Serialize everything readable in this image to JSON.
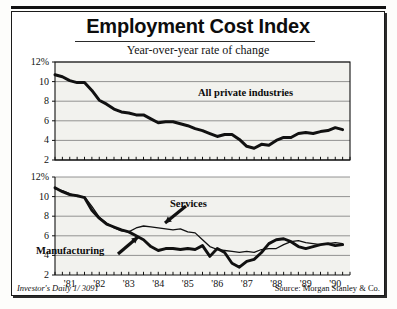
{
  "header": {
    "title": "Employment Cost Index",
    "subtitle": "Year-over-year rate of change"
  },
  "footer": {
    "left": "Investor's Daily 1/ 3091",
    "right": "Source: Morgan Stanley & Co."
  },
  "chart_data": [
    {
      "type": "line",
      "id": "all-private-industries",
      "title": "All private industries",
      "xlabel": "",
      "ylabel": "",
      "ylim": [
        2,
        12
      ],
      "yticks": [
        2,
        4,
        6,
        8,
        10,
        12
      ],
      "ytick_labels": [
        "2",
        "4",
        "6",
        "8",
        "10",
        "12%"
      ],
      "grid": true,
      "legend_position": "inline-annotation",
      "xlim": [
        1981.0,
        1991.0
      ],
      "x": [
        1981.0,
        1981.25,
        1981.5,
        1981.75,
        1982.0,
        1982.25,
        1982.5,
        1982.75,
        1983.0,
        1983.25,
        1983.5,
        1983.75,
        1984.0,
        1984.25,
        1984.5,
        1984.75,
        1985.0,
        1985.25,
        1985.5,
        1985.75,
        1986.0,
        1986.25,
        1986.5,
        1986.75,
        1987.0,
        1987.25,
        1987.5,
        1987.75,
        1988.0,
        1988.25,
        1988.5,
        1988.75,
        1989.0,
        1989.25,
        1989.5,
        1989.75,
        1990.0,
        1990.25,
        1990.5,
        1990.75
      ],
      "series": [
        {
          "name": "All private industries",
          "values": [
            10.7,
            10.5,
            10.1,
            9.9,
            9.9,
            9.1,
            8.1,
            7.7,
            7.2,
            6.9,
            6.8,
            6.6,
            6.6,
            6.2,
            5.8,
            5.9,
            5.9,
            5.7,
            5.5,
            5.2,
            5.0,
            4.7,
            4.4,
            4.6,
            4.6,
            4.1,
            3.4,
            3.2,
            3.6,
            3.5,
            4.0,
            4.3,
            4.3,
            4.7,
            4.8,
            4.7,
            4.9,
            5.0,
            5.3,
            5.1
          ]
        }
      ]
    },
    {
      "type": "line",
      "id": "manufacturing-vs-services",
      "title": "",
      "xlabel": "",
      "ylabel": "",
      "ylim": [
        2,
        12
      ],
      "yticks": [
        2,
        4,
        6,
        8,
        10,
        12
      ],
      "ytick_labels": [
        "2",
        "4",
        "6",
        "8",
        "10",
        "12%"
      ],
      "grid": true,
      "legend_position": "inline-annotation",
      "xlim": [
        1981.0,
        1991.0
      ],
      "xtick_labels": [
        "'81",
        "'82",
        "'83",
        "'84",
        "'85",
        "'86",
        "'87",
        "'88",
        "'89",
        "'90"
      ],
      "xticks": [
        1981.5,
        1982.5,
        1983.5,
        1984.5,
        1985.5,
        1986.5,
        1987.5,
        1988.5,
        1989.5,
        1990.5
      ],
      "x": [
        1981.0,
        1981.25,
        1981.5,
        1981.75,
        1982.0,
        1982.25,
        1982.5,
        1982.75,
        1983.0,
        1983.25,
        1983.5,
        1983.75,
        1984.0,
        1984.25,
        1984.5,
        1984.75,
        1985.0,
        1985.25,
        1985.5,
        1985.75,
        1986.0,
        1986.25,
        1986.5,
        1986.75,
        1987.0,
        1987.25,
        1987.5,
        1987.75,
        1988.0,
        1988.25,
        1988.5,
        1988.75,
        1989.0,
        1989.25,
        1989.5,
        1989.75,
        1990.0,
        1990.25,
        1990.5,
        1990.75
      ],
      "series": [
        {
          "name": "Manufacturing",
          "values": [
            10.9,
            10.5,
            10.2,
            10.1,
            9.9,
            8.6,
            7.8,
            7.2,
            6.9,
            6.6,
            6.4,
            6.0,
            5.6,
            4.9,
            4.5,
            4.7,
            4.7,
            4.6,
            4.7,
            4.6,
            5.0,
            3.9,
            4.7,
            4.3,
            3.2,
            2.8,
            3.4,
            3.6,
            4.3,
            5.2,
            5.6,
            5.7,
            5.4,
            4.9,
            4.7,
            4.9,
            5.1,
            5.2,
            5.0,
            5.1
          ]
        },
        {
          "name": "Services",
          "values": [
            10.8,
            10.6,
            10.3,
            10.0,
            10.0,
            9.0,
            7.9,
            7.3,
            6.8,
            6.5,
            6.4,
            6.8,
            7.0,
            6.9,
            6.8,
            6.7,
            6.6,
            6.7,
            6.4,
            6.3,
            5.6,
            4.9,
            4.6,
            4.5,
            4.4,
            4.3,
            4.4,
            4.3,
            4.6,
            4.7,
            4.7,
            5.1,
            5.4,
            5.5,
            5.3,
            5.2,
            5.1,
            5.2,
            5.3,
            5.2
          ]
        }
      ],
      "annotations": [
        {
          "text": "Services",
          "x": 1985.2,
          "y": 8.6
        },
        {
          "text": "Manufacturing",
          "x": 1981.2,
          "y": 3.6
        }
      ]
    }
  ],
  "colors": {
    "ink": "#111111",
    "grid": "#7a7a7a",
    "plot_bg": "#f2f2ee",
    "frame": "#1a1a1a"
  }
}
